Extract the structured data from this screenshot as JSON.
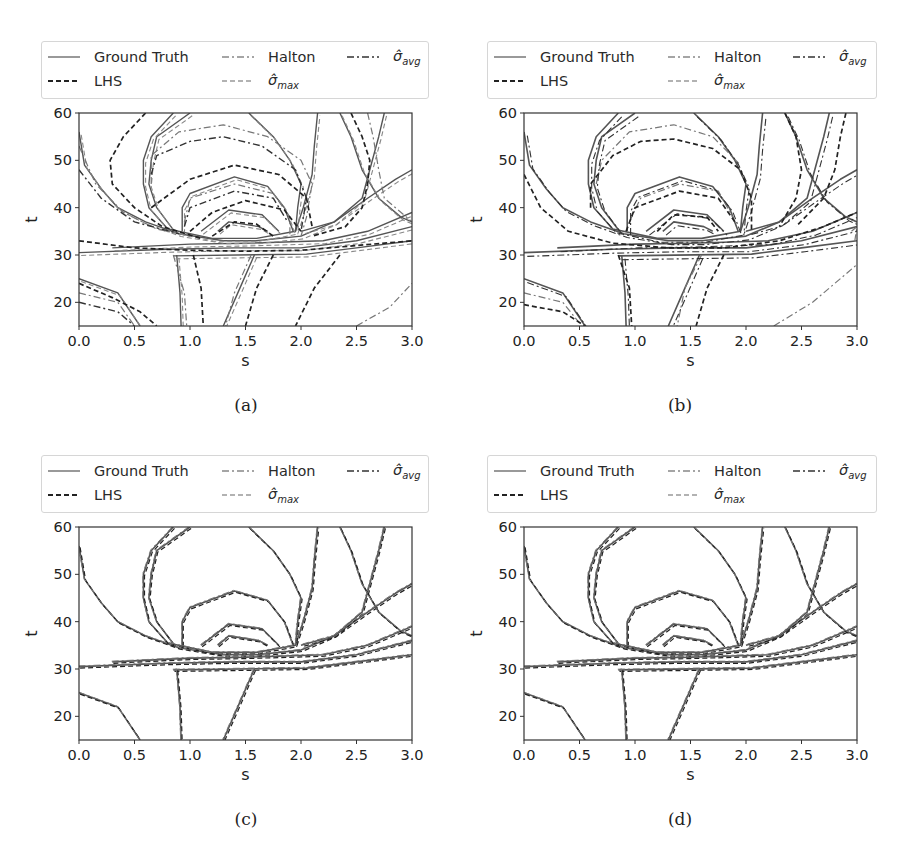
{
  "legend": {
    "items": [
      {
        "key": "gt",
        "label": "Ground Truth",
        "style": "solid"
      },
      {
        "key": "lhs",
        "label": "LHS",
        "style": "dashed"
      },
      {
        "key": "halton",
        "label": "Halton",
        "style": "dashdot-light"
      },
      {
        "key": "smax",
        "label": "σ̂",
        "sub": "max",
        "style": "dashed-light"
      },
      {
        "key": "savg",
        "label": "σ̂",
        "sub": "avg",
        "style": "dashdot"
      }
    ]
  },
  "axes": {
    "xlabel": "s",
    "ylabel": "t",
    "xticks": [
      "0.0",
      "0.5",
      "1.0",
      "1.5",
      "2.0",
      "2.5",
      "3.0"
    ],
    "xtick_values": [
      0,
      0.5,
      1,
      1.5,
      2,
      2.5,
      3
    ],
    "yticks": [
      "20",
      "30",
      "40",
      "50",
      "60"
    ],
    "ytick_values": [
      20,
      30,
      40,
      50,
      60
    ],
    "xlim": [
      0,
      3
    ],
    "ylim": [
      15,
      60
    ]
  },
  "panels": [
    {
      "id": "a",
      "caption": "(a)"
    },
    {
      "id": "b",
      "caption": "(b)"
    },
    {
      "id": "c",
      "caption": "(c)"
    },
    {
      "id": "d",
      "caption": "(d)"
    }
  ],
  "colors": {
    "gt": "#555555",
    "lhs": "#222222",
    "halton": "#777777",
    "smax": "#888888",
    "savg": "#333333",
    "axis": "#333333"
  },
  "chart_data": [
    {
      "type": "contour",
      "panel": "(a)",
      "title": "",
      "xlabel": "s",
      "ylabel": "t",
      "xlim": [
        0,
        3
      ],
      "ylim": [
        15,
        60
      ],
      "legend_position": "top (above axes)",
      "series": [
        "Ground Truth",
        "LHS",
        "Halton",
        "σ̂_max",
        "σ̂_avg"
      ],
      "note": "Large disagreement: LHS and Halton contours deviate strongly from ground truth; dense cluster of levels near s≈1.3–1.7, t≈30–35"
    },
    {
      "type": "contour",
      "panel": "(b)",
      "xlabel": "s",
      "ylabel": "t",
      "xlim": [
        0,
        3
      ],
      "ylim": [
        15,
        60
      ],
      "series": [
        "Ground Truth",
        "LHS",
        "Halton",
        "σ̂_max",
        "σ̂_avg"
      ],
      "note": "Moderate disagreement; surrogate contours closer to ground truth than (a)"
    },
    {
      "type": "contour",
      "panel": "(c)",
      "xlabel": "s",
      "ylabel": "t",
      "xlim": [
        0,
        3
      ],
      "ylim": [
        15,
        60
      ],
      "series": [
        "Ground Truth",
        "LHS",
        "Halton",
        "σ̂_max",
        "σ̂_avg"
      ],
      "note": "All methods nearly coincide with ground truth"
    },
    {
      "type": "contour",
      "panel": "(d)",
      "xlabel": "s",
      "ylabel": "t",
      "xlim": [
        0,
        3
      ],
      "ylim": [
        15,
        60
      ],
      "series": [
        "Ground Truth",
        "LHS",
        "Halton",
        "σ̂_max",
        "σ̂_avg"
      ],
      "note": "All methods nearly coincide with ground truth"
    }
  ],
  "contours": {
    "truth": [
      [
        [
          0,
          56
        ],
        [
          0.05,
          49
        ],
        [
          0.2,
          44
        ],
        [
          0.35,
          40
        ],
        [
          0.6,
          37
        ],
        [
          0.9,
          34.5
        ],
        [
          1.3,
          33
        ],
        [
          1.6,
          33
        ],
        [
          2.0,
          34
        ],
        [
          2.3,
          37
        ],
        [
          2.6,
          42
        ],
        [
          2.85,
          46
        ],
        [
          3.0,
          48
        ]
      ],
      [
        [
          0.85,
          60
        ],
        [
          0.65,
          55
        ],
        [
          0.58,
          50
        ],
        [
          0.58,
          45
        ],
        [
          0.63,
          40
        ],
        [
          0.8,
          35.5
        ],
        [
          1.2,
          33.5
        ],
        [
          1.6,
          33.5
        ],
        [
          1.95,
          35
        ],
        [
          2.02,
          40
        ],
        [
          2.1,
          47
        ],
        [
          2.12,
          53
        ],
        [
          2.15,
          60
        ]
      ],
      [
        [
          1.0,
          60
        ],
        [
          0.7,
          55
        ],
        [
          0.65,
          50
        ],
        [
          0.63,
          45
        ],
        [
          0.7,
          40
        ],
        [
          0.86,
          35
        ]
      ],
      [
        [
          1.53,
          60
        ],
        [
          1.75,
          55
        ],
        [
          1.9,
          50
        ],
        [
          2.0,
          45
        ],
        [
          1.97,
          40
        ],
        [
          1.95,
          35
        ]
      ],
      [
        [
          0.93,
          35
        ],
        [
          0.93,
          40
        ],
        [
          1.0,
          43
        ],
        [
          1.4,
          46.5
        ],
        [
          1.7,
          44.5
        ],
        [
          1.85,
          40
        ],
        [
          1.93,
          35
        ]
      ],
      [
        [
          1.1,
          35
        ],
        [
          1.35,
          39.5
        ],
        [
          1.65,
          38.5
        ],
        [
          1.8,
          35
        ]
      ],
      [
        [
          1.25,
          35
        ],
        [
          1.35,
          37
        ],
        [
          1.62,
          36
        ],
        [
          1.7,
          35
        ]
      ],
      [
        [
          0,
          30.5
        ],
        [
          0.8,
          31.2
        ],
        [
          1.4,
          31.5
        ],
        [
          2.0,
          31.5
        ],
        [
          2.5,
          33
        ],
        [
          3.0,
          36
        ]
      ],
      [
        [
          0.3,
          31.5
        ],
        [
          1.0,
          32.3
        ],
        [
          1.5,
          32.5
        ],
        [
          2.2,
          33
        ],
        [
          2.6,
          35
        ],
        [
          3.0,
          39
        ]
      ],
      [
        [
          0.85,
          29.8
        ],
        [
          2.05,
          30.2
        ],
        [
          2.5,
          31.5
        ],
        [
          3.0,
          33
        ]
      ],
      [
        [
          0.88,
          30
        ],
        [
          0.91,
          22
        ],
        [
          0.92,
          15
        ]
      ],
      [
        [
          1.58,
          30
        ],
        [
          1.45,
          23
        ],
        [
          1.3,
          15
        ]
      ],
      [
        [
          0,
          25
        ],
        [
          0.35,
          22
        ],
        [
          0.55,
          15
        ]
      ],
      [
        [
          2.35,
          60
        ],
        [
          2.45,
          55
        ],
        [
          2.55,
          48
        ],
        [
          2.7,
          42
        ],
        [
          2.9,
          38
        ],
        [
          3.0,
          37
        ]
      ],
      [
        [
          2.75,
          60
        ],
        [
          2.7,
          55
        ],
        [
          2.62,
          48
        ],
        [
          2.55,
          42
        ],
        [
          2.3,
          37
        ],
        [
          2.0,
          35
        ]
      ]
    ],
    "a_lhs": [
      [
        [
          0,
          33
        ],
        [
          0.5,
          31.5
        ],
        [
          1.0,
          31
        ],
        [
          1.5,
          30.8
        ],
        [
          2.0,
          31
        ],
        [
          2.5,
          32
        ],
        [
          3.0,
          33
        ]
      ],
      [
        [
          0.6,
          60
        ],
        [
          0.4,
          55
        ],
        [
          0.28,
          50
        ],
        [
          0.3,
          45
        ],
        [
          0.5,
          40
        ],
        [
          0.75,
          36
        ],
        [
          1.1,
          33.5
        ]
      ],
      [
        [
          2.45,
          60
        ],
        [
          2.55,
          55
        ],
        [
          2.62,
          50
        ],
        [
          2.6,
          45
        ],
        [
          2.55,
          40
        ],
        [
          2.4,
          36
        ],
        [
          2.1,
          34
        ]
      ],
      [
        [
          0.65,
          40
        ],
        [
          1.0,
          46
        ],
        [
          1.4,
          49
        ],
        [
          1.8,
          47
        ],
        [
          2.05,
          42
        ],
        [
          2.1,
          36
        ]
      ],
      [
        [
          1.0,
          35
        ],
        [
          1.2,
          39
        ],
        [
          1.5,
          41.5
        ],
        [
          1.85,
          39.5
        ],
        [
          2.0,
          35
        ]
      ],
      [
        [
          1.2,
          34
        ],
        [
          1.4,
          37
        ],
        [
          1.6,
          36.5
        ],
        [
          1.75,
          34
        ]
      ],
      [
        [
          1.03,
          30
        ],
        [
          1.1,
          23
        ],
        [
          1.12,
          15
        ]
      ],
      [
        [
          1.75,
          30
        ],
        [
          1.6,
          23
        ],
        [
          1.5,
          15
        ]
      ],
      [
        [
          2.35,
          30
        ],
        [
          2.12,
          23
        ],
        [
          1.95,
          15
        ]
      ],
      [
        [
          0,
          24
        ],
        [
          0.3,
          21
        ],
        [
          0.55,
          18
        ],
        [
          0.7,
          15
        ]
      ]
    ],
    "a_halton": [
      [
        [
          0,
          53
        ],
        [
          0.15,
          45
        ],
        [
          0.4,
          39
        ],
        [
          0.7,
          35.5
        ],
        [
          1.0,
          34
        ]
      ],
      [
        [
          0.65,
          45
        ],
        [
          0.65,
          51
        ],
        [
          0.9,
          56
        ],
        [
          1.3,
          57.5
        ],
        [
          1.7,
          55
        ],
        [
          2.0,
          50
        ],
        [
          2.1,
          45
        ],
        [
          2.05,
          38
        ],
        [
          2.0,
          34
        ]
      ],
      [
        [
          0.95,
          37
        ],
        [
          1.0,
          42
        ],
        [
          1.4,
          45
        ],
        [
          1.75,
          43
        ],
        [
          1.9,
          38
        ],
        [
          1.9,
          34
        ]
      ],
      [
        [
          0.85,
          30
        ],
        [
          0.95,
          22
        ],
        [
          0.97,
          15
        ]
      ],
      [
        [
          1.55,
          30
        ],
        [
          1.4,
          22
        ],
        [
          1.32,
          15
        ]
      ],
      [
        [
          0,
          22
        ],
        [
          0.35,
          20
        ],
        [
          0.5,
          15
        ]
      ],
      [
        [
          2.5,
          15
        ],
        [
          2.8,
          19
        ],
        [
          3.0,
          24
        ]
      ],
      [
        [
          2.6,
          60
        ],
        [
          2.65,
          55
        ],
        [
          2.7,
          48
        ],
        [
          2.75,
          42
        ],
        [
          2.95,
          38
        ],
        [
          3.0,
          37
        ]
      ]
    ],
    "a_savg": [
      [
        [
          0.65,
          47
        ],
        [
          0.7,
          51
        ],
        [
          1.0,
          54
        ],
        [
          1.3,
          55
        ],
        [
          1.65,
          53
        ],
        [
          1.95,
          48
        ],
        [
          2.05,
          42
        ],
        [
          2.0,
          35
        ]
      ],
      [
        [
          0.95,
          36
        ],
        [
          1.0,
          40
        ],
        [
          1.4,
          43.5
        ],
        [
          1.75,
          42
        ],
        [
          1.88,
          37
        ]
      ],
      [
        [
          0,
          20
        ],
        [
          0.35,
          18
        ],
        [
          0.5,
          15
        ]
      ],
      [
        [
          0,
          48
        ],
        [
          0.2,
          42
        ],
        [
          0.5,
          37
        ],
        [
          0.9,
          34.5
        ]
      ]
    ],
    "b_lhs": [
      [
        [
          0,
          47
        ],
        [
          0.15,
          40
        ],
        [
          0.4,
          35
        ],
        [
          0.8,
          32.5
        ],
        [
          1.3,
          31.5
        ],
        [
          1.8,
          31.5
        ],
        [
          2.3,
          33
        ],
        [
          2.7,
          36
        ],
        [
          3.0,
          39
        ]
      ],
      [
        [
          0.6,
          40
        ],
        [
          0.6,
          45
        ],
        [
          0.8,
          51
        ],
        [
          1.05,
          54
        ],
        [
          1.35,
          54.5
        ],
        [
          1.7,
          52.5
        ],
        [
          1.95,
          48
        ],
        [
          2.05,
          42
        ],
        [
          2.05,
          35
        ]
      ],
      [
        [
          0.92,
          35
        ],
        [
          1.0,
          40
        ],
        [
          1.4,
          43.5
        ],
        [
          1.75,
          42
        ],
        [
          1.9,
          37
        ]
      ],
      [
        [
          1.2,
          35
        ],
        [
          1.35,
          38.5
        ],
        [
          1.65,
          38
        ],
        [
          1.75,
          35
        ]
      ],
      [
        [
          0,
          19.5
        ],
        [
          0.35,
          18
        ],
        [
          0.55,
          15
        ]
      ],
      [
        [
          0.85,
          30
        ],
        [
          0.95,
          23
        ],
        [
          0.97,
          15
        ]
      ],
      [
        [
          1.8,
          30
        ],
        [
          1.65,
          23
        ],
        [
          1.55,
          15
        ]
      ],
      [
        [
          2.35,
          60
        ],
        [
          2.45,
          55
        ],
        [
          2.5,
          48
        ],
        [
          2.45,
          42
        ],
        [
          2.3,
          36
        ]
      ],
      [
        [
          2.9,
          60
        ],
        [
          2.85,
          55
        ],
        [
          2.8,
          48
        ],
        [
          2.7,
          42
        ],
        [
          2.45,
          36
        ]
      ]
    ],
    "b_halton": [
      [
        [
          0.65,
          45
        ],
        [
          0.7,
          50
        ],
        [
          0.95,
          56
        ],
        [
          1.35,
          57.5
        ],
        [
          1.7,
          55
        ],
        [
          1.95,
          49
        ]
      ],
      [
        [
          0.95,
          37
        ],
        [
          1.05,
          42
        ],
        [
          1.4,
          45
        ],
        [
          1.75,
          43.5
        ],
        [
          1.88,
          38
        ]
      ],
      [
        [
          2.25,
          15
        ],
        [
          2.6,
          20
        ],
        [
          3.0,
          28
        ]
      ],
      [
        [
          2.95,
          35
        ],
        [
          3.0,
          36
        ],
        [
          2.98,
          33
        ]
      ],
      [
        [
          0,
          22
        ],
        [
          0.35,
          20
        ],
        [
          0.52,
          15
        ]
      ],
      [
        [
          1.6,
          30
        ],
        [
          1.45,
          23
        ],
        [
          1.38,
          15
        ]
      ]
    ],
    "c_shift": 0.3
  }
}
